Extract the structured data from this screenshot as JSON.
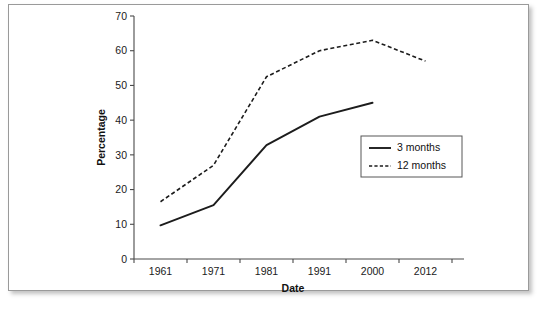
{
  "chart_data": {
    "type": "line",
    "title": "",
    "xlabel": "Date",
    "ylabel": "Percentage",
    "categories": [
      "1961",
      "1971",
      "1981",
      "1991",
      "2000",
      "2012"
    ],
    "ylim": [
      0,
      70
    ],
    "yticks": [
      "0",
      "10",
      "20",
      "30",
      "40",
      "50",
      "60",
      "70"
    ],
    "ytick_values": [
      0,
      10,
      20,
      30,
      40,
      50,
      60,
      70
    ],
    "grid": false,
    "legend_position": "center-right",
    "series": [
      {
        "name": "3 months",
        "style": "solid",
        "color": "#1c1c1c",
        "values": [
          9.7,
          15.5,
          32.8,
          41.0,
          45.0,
          null
        ]
      },
      {
        "name": "12 months",
        "style": "dashed",
        "color": "#1c1c1c",
        "values": [
          16.5,
          27.0,
          52.5,
          60.0,
          63.0,
          57.0
        ]
      }
    ]
  },
  "legend": {
    "items": [
      {
        "label": "3 months"
      },
      {
        "label": "12 months"
      }
    ]
  },
  "colors": {
    "frame_border": "#9a9a9a",
    "axis": "#4a4a4a",
    "ink": "#1c1c1c",
    "background": "#ffffff"
  }
}
